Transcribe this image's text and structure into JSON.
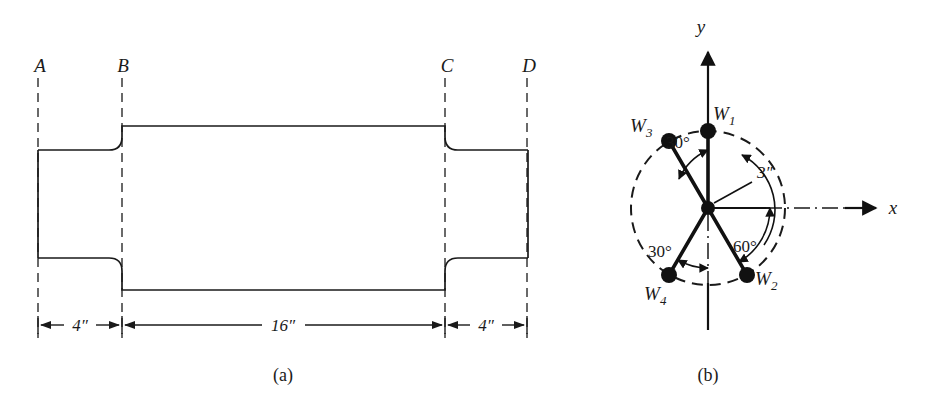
{
  "figure": {
    "background": "#ffffff",
    "ink": "#1a1a1a",
    "width": 933,
    "height": 403
  },
  "panel_a": {
    "caption": "(a)",
    "caption_pos": {
      "x": 283,
      "y": 381
    },
    "station_labels": [
      {
        "name": "A",
        "text": "A",
        "x": 40,
        "y": 72,
        "line_x": 38,
        "line_top": 78,
        "line_bottom": 338
      },
      {
        "name": "B",
        "text": "B",
        "x": 123,
        "y": 72,
        "line_x": 122,
        "line_top": 78,
        "line_bottom": 338
      },
      {
        "name": "C",
        "text": "C",
        "x": 447,
        "y": 72,
        "line_x": 445,
        "line_top": 78,
        "line_bottom": 338
      },
      {
        "name": "D",
        "text": "D",
        "x": 529,
        "y": 72,
        "line_x": 527,
        "line_top": 78,
        "line_bottom": 338
      }
    ],
    "shaft": {
      "left_end_x": 38,
      "step_left_x": 122,
      "step_right_x": 445,
      "right_end_x": 528,
      "small_top_y": 150,
      "small_bottom_y": 258,
      "large_top_y": 126,
      "large_bottom_y": 290,
      "fillet_radius": 13
    },
    "dimensions": [
      {
        "name": "left-segment",
        "label": "4″",
        "from_x": 38,
        "to_x": 122,
        "y": 325,
        "label_x": 80
      },
      {
        "name": "middle-segment",
        "label": "16″",
        "from_x": 122,
        "to_x": 445,
        "y": 325,
        "label_x": 283
      },
      {
        "name": "right-segment",
        "label": "4″",
        "from_x": 445,
        "to_x": 527,
        "y": 325,
        "label_x": 486
      }
    ]
  },
  "panel_b": {
    "caption": "(b)",
    "caption_pos": {
      "x": 708,
      "y": 381
    },
    "center": {
      "x": 708,
      "y": 208
    },
    "circle_radius": 77,
    "radius_label": "3″",
    "radius_label_pos": {
      "x": 757,
      "y": 178
    },
    "axes": {
      "y_label": "y",
      "y_label_pos": {
        "x": 701,
        "y": 33
      },
      "y_arrow_tip_y": 48,
      "y_bottom_y": 330,
      "x_label": "x",
      "x_label_pos": {
        "x": 893,
        "y": 214
      },
      "x_arrow_tip_x": 872
    },
    "weights": [
      {
        "name": "W1",
        "label": "W",
        "sub": "1",
        "angle_deg": 90,
        "label_x": 722,
        "label_y": 120
      },
      {
        "name": "W2",
        "label": "W",
        "sub": "2",
        "angle_deg": -60,
        "label_x": 760,
        "label_y": 285
      },
      {
        "name": "W3",
        "label": "W",
        "sub": "3",
        "angle_deg": 120,
        "label_x": 638,
        "label_y": 132
      },
      {
        "name": "W4",
        "label": "W",
        "sub": "4",
        "angle_deg": 240,
        "label_x": 651,
        "label_y": 300
      }
    ],
    "angle_arcs": [
      {
        "name": "angle-w3-to-y",
        "label": "30°",
        "from_deg": 120,
        "to_deg": 90,
        "radius": 58,
        "label_x": 678,
        "label_y": 148
      },
      {
        "name": "angle-x-to-w2",
        "label": "60°",
        "from_deg": 0,
        "to_deg": -60,
        "radius": 62,
        "label_x": 745,
        "label_y": 252
      },
      {
        "name": "angle-y-to-w4",
        "label": "30°",
        "label_x": 660,
        "label_y": 257,
        "from_deg": 240,
        "to_deg": 270,
        "radius": 60
      }
    ]
  }
}
